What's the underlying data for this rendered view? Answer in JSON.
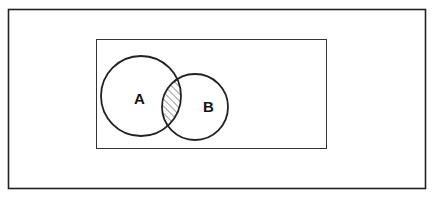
{
  "diagram": {
    "type": "venn",
    "universe_label": "",
    "sets": [
      {
        "label": "A"
      },
      {
        "label": "B"
      }
    ],
    "shaded_region": "A ∩ B",
    "colors": {
      "stroke": "#222222",
      "background": "#ffffff",
      "hatch": "#333333"
    }
  }
}
